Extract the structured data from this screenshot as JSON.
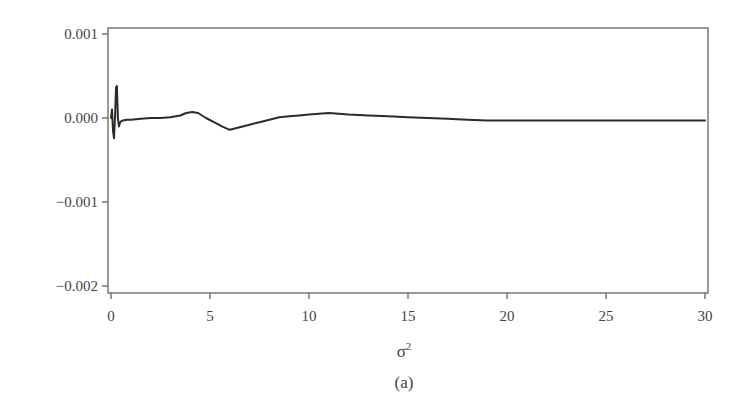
{
  "chart_data": {
    "type": "line",
    "title": "",
    "caption": "(a)",
    "xlabel": "σ",
    "xlabel_superscript": "2",
    "ylabel": "",
    "xlim": [
      0,
      30
    ],
    "ylim": [
      -0.002,
      0.001
    ],
    "grid": false,
    "legend": null,
    "x_ticks": [
      0,
      5,
      10,
      15,
      20,
      25,
      30
    ],
    "x_tick_labels": [
      "0",
      "5",
      "10",
      "15",
      "20",
      "25",
      "30"
    ],
    "y_ticks": [
      0.001,
      0.0,
      -0.001,
      -0.002
    ],
    "y_tick_labels": [
      "0.001",
      "0.000",
      "−0.001",
      "−0.002"
    ],
    "series": [
      {
        "name": "curve",
        "color": "#2b2b2b",
        "x": [
          0.0,
          0.05,
          0.1,
          0.15,
          0.2,
          0.25,
          0.3,
          0.35,
          0.4,
          0.45,
          0.5,
          0.6,
          0.8,
          1.0,
          1.5,
          2.0,
          2.5,
          3.0,
          3.5,
          3.8,
          4.1,
          4.4,
          4.8,
          5.2,
          5.6,
          6.0,
          6.5,
          7.0,
          7.5,
          8.0,
          8.5,
          9.0,
          9.5,
          10.0,
          10.5,
          11.0,
          11.5,
          12.0,
          13.0,
          14.0,
          15.0,
          16.0,
          17.0,
          18.0,
          19.0,
          20.0,
          21.0,
          22.0,
          23.0,
          24.0,
          25.0,
          26.0,
          27.0,
          28.0,
          29.0,
          30.0
        ],
        "y": [
          0.0,
          0.0001,
          -0.00015,
          -0.00024,
          0.0,
          0.00036,
          0.00038,
          0.0,
          -0.0001,
          -6e-05,
          -4e-05,
          -3e-05,
          -2e-05,
          -2e-05,
          -1e-05,
          0.0,
          0.0,
          1e-05,
          3e-05,
          6e-05,
          7e-05,
          6e-05,
          0.0,
          -5e-05,
          -0.0001,
          -0.00014,
          -0.00011,
          -8e-05,
          -5e-05,
          -2e-05,
          1e-05,
          2e-05,
          3e-05,
          4e-05,
          5e-05,
          6e-05,
          5e-05,
          4e-05,
          3e-05,
          2e-05,
          1e-05,
          0.0,
          -1e-05,
          -2e-05,
          -3e-05,
          -3e-05,
          -3e-05,
          -3e-05,
          -3e-05,
          -3e-05,
          -3e-05,
          -3e-05,
          -3e-05,
          -3e-05,
          -3e-05,
          -3e-05
        ]
      }
    ]
  },
  "layout": {
    "plot_left": 108,
    "plot_top": 28,
    "plot_right": 708,
    "plot_bottom": 293,
    "x0_px": 111,
    "x30_px": 705,
    "y_top_tick_px": 34,
    "y_bottom_tick_px": 286
  }
}
